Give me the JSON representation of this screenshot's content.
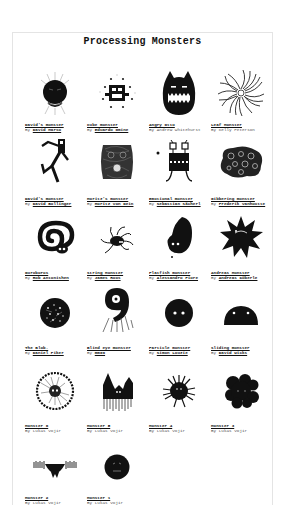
{
  "page": {
    "title": "Processing Monsters"
  },
  "by_prefix": "By",
  "monsters": [
    {
      "title": "David's monster",
      "author": "David Marso",
      "author_link": true,
      "icon": "round-spiky-monster-icon"
    },
    {
      "title": "Cube monster",
      "author": "Eduardo Omine",
      "author_link": true,
      "icon": "cube-robot-monster-icon"
    },
    {
      "title": "Angry Otto",
      "author": "Andrew Whitehurst",
      "author_link": false,
      "icon": "horned-angry-monster-icon"
    },
    {
      "title": "Leaf Monster",
      "author": "Kelly Peterson",
      "author_link": false,
      "icon": "spiral-leaf-monster-icon"
    },
    {
      "title": "David's monster",
      "author": "David Bollinger",
      "author_link": true,
      "icon": "dancing-stick-monster-icon"
    },
    {
      "title": "Moritz's monster",
      "author": "Moritz von Dein",
      "author_link": true,
      "icon": "scribble-face-monster-icon"
    },
    {
      "title": "Emotional monster",
      "author": "Sebastian Sächerl",
      "author_link": true,
      "icon": "robot-legs-monster-icon"
    },
    {
      "title": "Gibbering monster",
      "author": "Frederik Vanhoutte",
      "author_link": true,
      "icon": "bubble-cluster-monster-icon"
    },
    {
      "title": "Ouroboros",
      "author": "Rob Antonishen",
      "author_link": true,
      "icon": "coiled-snake-monster-icon"
    },
    {
      "title": "String Monster",
      "author": "James Roos",
      "author_link": true,
      "icon": "spider-string-monster-icon"
    },
    {
      "title": "Flatfish monster",
      "author": "Alessandro Fiore",
      "author_link": true,
      "icon": "flatfish-blob-monster-icon"
    },
    {
      "title": "Andreas Monster",
      "author": "Andreas Köberle",
      "author_link": true,
      "icon": "star-burst-monster-icon"
    },
    {
      "title": "The Blob.",
      "author": "Daniel Piker",
      "author_link": true,
      "icon": "speckled-blob-monster-icon"
    },
    {
      "title": "Blind eye monster",
      "author": "mm09",
      "author_link": true,
      "icon": "one-eye-nine-monster-icon"
    },
    {
      "title": "Particle monster",
      "author": "Simon Louzie",
      "author_link": true,
      "icon": "round-two-eye-monster-icon"
    },
    {
      "title": "Sliding monster",
      "author": "David Wicks",
      "author_link": true,
      "icon": "dome-sliding-monster-icon"
    },
    {
      "title": "Monster 6",
      "author": "Lukas Vojir",
      "author_link": false,
      "icon": "hairy-circle-monster-icon"
    },
    {
      "title": "Monster 5",
      "author": "Lukas Vojir",
      "author_link": false,
      "icon": "castle-spire-monster-icon"
    },
    {
      "title": "Monster 4",
      "author": "Lukas Vojir",
      "author_link": false,
      "icon": "fuzzy-tree-monster-icon"
    },
    {
      "title": "Monster 3",
      "author": "Lukas Vojir",
      "author_link": false,
      "icon": "lumpy-block-monster-icon"
    },
    {
      "title": "Monster 2",
      "author": "Lukas Vojir",
      "author_link": false,
      "icon": "winged-bar-monster-icon"
    },
    {
      "title": "Monster 1",
      "author": "Lukas Vojir",
      "author_link": false,
      "icon": "round-face-monster-icon"
    }
  ]
}
